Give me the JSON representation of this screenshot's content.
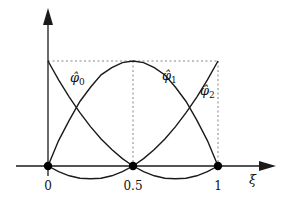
{
  "figure": {
    "type": "quadratic Lagrange basis functions on reference element",
    "x_axis": {
      "label": "ξ",
      "ticks": [
        "0",
        "0.5",
        "1"
      ]
    },
    "curves": [
      {
        "name": "φ̂0",
        "base": "φ̂",
        "sub": "0"
      },
      {
        "name": "φ̂1",
        "base": "φ̂",
        "sub": "1"
      },
      {
        "name": "φ̂2",
        "base": "φ̂",
        "sub": "2"
      }
    ],
    "nodes": [
      "0",
      "0.5",
      "1"
    ],
    "colors": {
      "line": "#1a1a1a",
      "guide": "#666666",
      "node": "#000000"
    }
  }
}
